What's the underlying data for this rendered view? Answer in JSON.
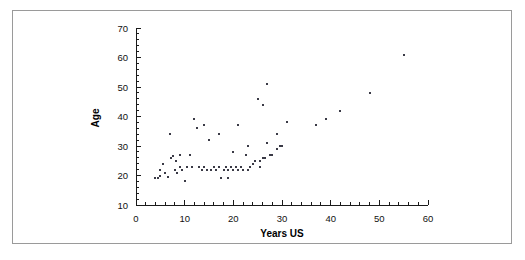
{
  "figure": {
    "background_color": "#ffffff",
    "frame_color": "#9a9a9a",
    "marker_color": "#3a3a46"
  },
  "axes": {
    "x_title": "Years US",
    "y_title": "Age",
    "x_ticks": [
      "0",
      "10",
      "20",
      "30",
      "40",
      "50",
      "60"
    ],
    "y_ticks": [
      "10",
      "20",
      "30",
      "40",
      "50",
      "60",
      "70"
    ]
  },
  "chart_data": {
    "type": "scatter",
    "title": "",
    "xlabel": "Years US",
    "ylabel": "Age",
    "xlim": [
      0,
      60
    ],
    "ylim": [
      10,
      70
    ],
    "xticks": [
      0,
      10,
      20,
      30,
      40,
      50,
      60
    ],
    "yticks": [
      10,
      20,
      30,
      40,
      50,
      60,
      70
    ],
    "x_minor_tick_step": 2,
    "y_minor_tick_step": 2,
    "grid": false,
    "legend": false,
    "marker": "square",
    "marker_size_px": 2,
    "points": [
      [
        4,
        19
      ],
      [
        4.5,
        19
      ],
      [
        5,
        22
      ],
      [
        5,
        20
      ],
      [
        5.5,
        24
      ],
      [
        6,
        21
      ],
      [
        6.5,
        19.5
      ],
      [
        7,
        34
      ],
      [
        7.2,
        26
      ],
      [
        7.5,
        26.5
      ],
      [
        8,
        22
      ],
      [
        8.2,
        25
      ],
      [
        8.5,
        21
      ],
      [
        9,
        27
      ],
      [
        9,
        23
      ],
      [
        9.5,
        22
      ],
      [
        10,
        18
      ],
      [
        10.5,
        23
      ],
      [
        11,
        27
      ],
      [
        11.5,
        23
      ],
      [
        12,
        39
      ],
      [
        12.5,
        36
      ],
      [
        13,
        23
      ],
      [
        13.5,
        22
      ],
      [
        14,
        37
      ],
      [
        14,
        23
      ],
      [
        14.5,
        22
      ],
      [
        15,
        32
      ],
      [
        15.5,
        22
      ],
      [
        16,
        23
      ],
      [
        16.5,
        22
      ],
      [
        17,
        34
      ],
      [
        17,
        23
      ],
      [
        17.5,
        19
      ],
      [
        18,
        22
      ],
      [
        18.5,
        23
      ],
      [
        19,
        22
      ],
      [
        19,
        19
      ],
      [
        19.5,
        23
      ],
      [
        20,
        28
      ],
      [
        20,
        22
      ],
      [
        20.5,
        23
      ],
      [
        21,
        37
      ],
      [
        21,
        22
      ],
      [
        21.5,
        23
      ],
      [
        22,
        22
      ],
      [
        22.5,
        27
      ],
      [
        23,
        30
      ],
      [
        23,
        22
      ],
      [
        23.5,
        23
      ],
      [
        24,
        24
      ],
      [
        24.5,
        25
      ],
      [
        25,
        46
      ],
      [
        25.5,
        25
      ],
      [
        25.5,
        23
      ],
      [
        26,
        26
      ],
      [
        26,
        44
      ],
      [
        26.5,
        26
      ],
      [
        27,
        51
      ],
      [
        27,
        31
      ],
      [
        27.5,
        27
      ],
      [
        28,
        27
      ],
      [
        29,
        34
      ],
      [
        29,
        29
      ],
      [
        29.5,
        30
      ],
      [
        30,
        30
      ],
      [
        31,
        38
      ],
      [
        37,
        37
      ],
      [
        39,
        39
      ],
      [
        42,
        42
      ],
      [
        48,
        48
      ],
      [
        55,
        61
      ]
    ]
  }
}
